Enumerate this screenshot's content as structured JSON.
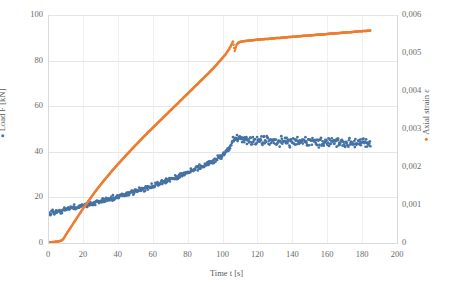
{
  "chart_data": {
    "type": "scatter",
    "title": "",
    "xlabel": "Time t [s]",
    "ylabel": "Load F [kN]",
    "y2label": "Axial strain ε",
    "xlim": [
      0,
      200
    ],
    "ylim": [
      0,
      100
    ],
    "y2lim": [
      0,
      0.006
    ],
    "grid": true,
    "legend_position": "axis-titles",
    "decimal_separator": ",",
    "x_ticks": [
      "0",
      "20",
      "40",
      "60",
      "80",
      "100",
      "120",
      "140",
      "160",
      "180",
      "200"
    ],
    "x_tick_values": [
      0,
      20,
      40,
      60,
      80,
      100,
      120,
      140,
      160,
      180,
      200
    ],
    "y_ticks": [
      "0",
      "20",
      "40",
      "60",
      "80",
      "100"
    ],
    "y_tick_values": [
      0,
      20,
      40,
      60,
      80,
      100
    ],
    "y2_ticks": [
      "0",
      "0,001",
      "0,002",
      "0,003",
      "0,004",
      "0,005",
      "0,006"
    ],
    "y2_tick_values": [
      0,
      0.001,
      0.002,
      0.003,
      0.004,
      0.005,
      0.006
    ],
    "series": [
      {
        "name": "Load F [kN]",
        "axis": "left",
        "color": "#4472A4",
        "marker": "dot",
        "noise_amplitude": 1.6,
        "x": [
          0,
          2,
          4,
          6,
          8,
          10,
          12,
          14,
          16,
          18,
          20,
          24,
          28,
          32,
          36,
          40,
          44,
          48,
          52,
          56,
          60,
          64,
          68,
          72,
          76,
          80,
          84,
          88,
          92,
          96,
          100,
          103,
          105,
          106,
          108,
          110,
          114,
          118,
          122,
          126,
          130,
          134,
          138,
          142,
          146,
          150,
          154,
          158,
          162,
          166,
          170,
          174,
          178,
          182,
          185
        ],
        "y": [
          13.0,
          13.3,
          13.6,
          13.9,
          14.2,
          14.6,
          14.9,
          15.3,
          15.6,
          16.0,
          16.4,
          17.1,
          17.8,
          18.6,
          19.4,
          20.2,
          21.1,
          22.0,
          23.0,
          24.0,
          25.0,
          26.1,
          27.2,
          28.4,
          29.6,
          30.9,
          32.2,
          33.6,
          35.0,
          36.5,
          38.2,
          40.5,
          42.8,
          46.2,
          45.6,
          45.3,
          45.0,
          44.9,
          44.8,
          44.8,
          44.7,
          44.6,
          44.6,
          44.5,
          44.4,
          44.3,
          44.2,
          44.2,
          44.1,
          44.0,
          44.0,
          43.9,
          43.8,
          43.8,
          43.7
        ]
      },
      {
        "name": "Axial strain ε",
        "axis": "right",
        "color": "#ED7D31",
        "marker": "dot",
        "noise_amplitude": 0.0,
        "x": [
          0,
          2,
          4,
          6,
          8,
          9,
          10,
          12,
          14,
          16,
          18,
          20,
          24,
          28,
          32,
          36,
          40,
          44,
          48,
          52,
          56,
          60,
          64,
          68,
          72,
          76,
          80,
          84,
          88,
          92,
          96,
          100,
          102,
          104,
          105,
          106,
          107,
          108,
          109,
          110,
          112,
          114,
          118,
          122,
          126,
          130,
          134,
          138,
          142,
          146,
          150,
          154,
          158,
          162,
          166,
          170,
          174,
          178,
          182,
          185
        ],
        "y": [
          2e-05,
          2e-05,
          3e-05,
          4e-05,
          7e-05,
          0.00012,
          0.0002,
          0.00034,
          0.00048,
          0.00062,
          0.00076,
          0.0009,
          0.00116,
          0.00141,
          0.00164,
          0.00186,
          0.00207,
          0.00227,
          0.00247,
          0.00266,
          0.00285,
          0.00303,
          0.00321,
          0.00339,
          0.00357,
          0.00375,
          0.00393,
          0.00411,
          0.00429,
          0.00447,
          0.00466,
          0.00487,
          0.00498,
          0.00512,
          0.00521,
          0.0053,
          0.00505,
          0.00521,
          0.00527,
          0.00529,
          0.00531,
          0.00532,
          0.00534,
          0.00536,
          0.00537,
          0.00539,
          0.0054,
          0.00542,
          0.00543,
          0.00545,
          0.00546,
          0.00548,
          0.00549,
          0.00551,
          0.00552,
          0.00554,
          0.00555,
          0.00557,
          0.00558,
          0.00559
        ]
      }
    ]
  },
  "axes": {
    "x_title": "Time t [s]",
    "y_left_title": "Load F [kN]",
    "y_right_title": "Axial strain ε"
  },
  "colors": {
    "series_load": "#4472A4",
    "series_strain": "#ED7D31",
    "gridline": "#e6e6e6",
    "axis": "#d9d9d9",
    "text": "#5a5a5a"
  }
}
